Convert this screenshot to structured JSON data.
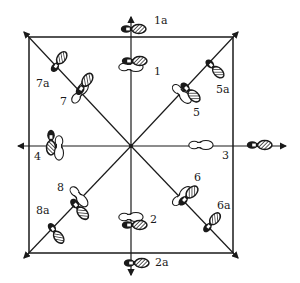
{
  "diagram": {
    "type": "dance foot positions",
    "colors": {
      "ink": "#1a1a1a",
      "paper": "#ffffff"
    },
    "positions": [
      {
        "id": "1",
        "label": "1"
      },
      {
        "id": "1a",
        "label": "1a"
      },
      {
        "id": "2",
        "label": "2"
      },
      {
        "id": "2a",
        "label": "2a"
      },
      {
        "id": "3",
        "label": "3"
      },
      {
        "id": "4",
        "label": "4"
      },
      {
        "id": "5",
        "label": "5"
      },
      {
        "id": "5a",
        "label": "5a"
      },
      {
        "id": "6",
        "label": "6"
      },
      {
        "id": "6a",
        "label": "6a"
      },
      {
        "id": "7",
        "label": "7"
      },
      {
        "id": "7a",
        "label": "7a"
      },
      {
        "id": "8",
        "label": "8"
      },
      {
        "id": "8a",
        "label": "8a"
      }
    ]
  }
}
